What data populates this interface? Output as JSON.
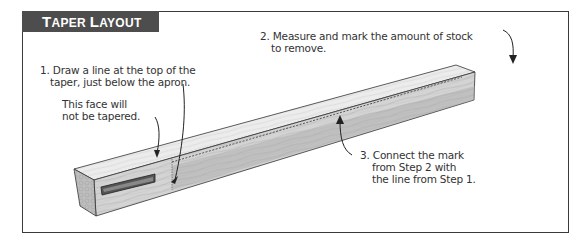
{
  "title": "Taper Layout",
  "title_parts": {
    "first_cap": "T",
    "first_rest": "APER",
    "second_cap": "L",
    "second_rest": "AYOUT"
  },
  "callouts": {
    "step1": {
      "line1": "1. Draw a line at the top of the",
      "line2": "taper, just below the apron."
    },
    "face_note": {
      "line1": "This face will",
      "line2": "not be tapered."
    },
    "step2": {
      "line1": "2. Measure and mark the amount of stock",
      "line2": "to remove."
    },
    "step3": {
      "line1": "3. Connect the mark",
      "line2": "from Step 2 with",
      "line3": "the line from Step 1."
    }
  },
  "illustration": {
    "subject": "table-leg-blank",
    "features": [
      "mortise",
      "dashed-taper-line",
      "layout-mark-line"
    ],
    "colors": {
      "wood_light": "#e6e6e6",
      "wood_mid": "#c8c8c8",
      "wood_dark": "#a9a9a9",
      "outline": "#333333",
      "header_bg": "#4d4d4d"
    }
  }
}
